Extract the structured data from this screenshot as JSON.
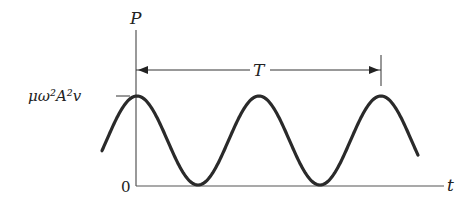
{
  "diagram": {
    "type": "power-vs-time waveform",
    "y_axis_label": "P",
    "x_axis_label": "t",
    "origin_label": "0",
    "peak_label": "μω²A²v",
    "period_label": "T",
    "colors": {
      "axis": "#555555",
      "curve": "#2a2a2a",
      "text": "#222222"
    }
  }
}
